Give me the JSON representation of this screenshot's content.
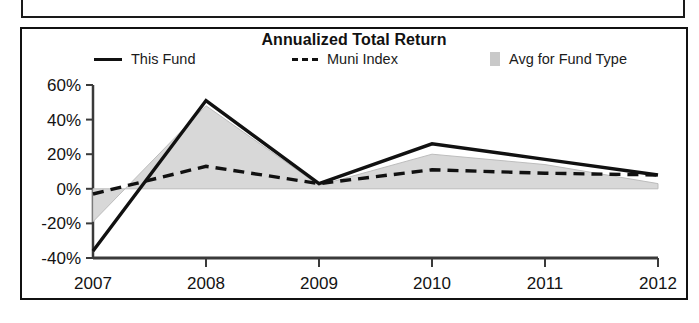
{
  "panel": {
    "title": "Annualized Total Return"
  },
  "legend": {
    "position": "top",
    "entries": [
      {
        "label": "This Fund",
        "marker": "solid-line-swatch",
        "color": "#111111"
      },
      {
        "label": "Muni Index",
        "marker": "dashed-line-swatch",
        "color": "#111111"
      },
      {
        "label": "Avg for Fund Type",
        "marker": "area-swatch",
        "color": "#c9c9c9"
      }
    ]
  },
  "chart_data": {
    "type": "line",
    "title": "Annualized Total Return",
    "xlabel": "",
    "ylabel": "",
    "categories": [
      "2007",
      "2008",
      "2009",
      "2010",
      "2011",
      "2012"
    ],
    "x_tick_labels": [
      "2007",
      "2008",
      "2009",
      "2010",
      "2011",
      "2012"
    ],
    "x_axis_suffix_label": "YTD",
    "y_tick_labels": [
      "60%",
      "40%",
      "20%",
      "0%",
      "-20%",
      "-40%"
    ],
    "y_tick_values": [
      60,
      40,
      20,
      0,
      -20,
      -40
    ],
    "ylim": [
      -40,
      60
    ],
    "grid": false,
    "series": [
      {
        "name": "This Fund",
        "style": "solid",
        "color": "#111111",
        "values": [
          -36,
          51,
          3,
          26,
          17,
          8
        ]
      },
      {
        "name": "Muni Index",
        "style": "dashed",
        "color": "#111111",
        "values": [
          -3,
          13,
          3,
          11,
          9,
          8
        ]
      },
      {
        "name": "Avg for Fund Type",
        "style": "area",
        "color": "#d4d4d4",
        "values": [
          -19,
          48,
          2,
          20,
          14,
          3
        ]
      }
    ]
  }
}
